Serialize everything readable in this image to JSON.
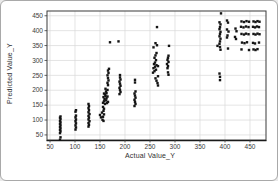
{
  "window": {
    "type": "chart-screenshot"
  },
  "chart_data": {
    "type": "scatter",
    "title": "",
    "xlabel": "Actual Value_Y",
    "ylabel": "Predicted Value_Y",
    "xlim": [
      44,
      482
    ],
    "ylim": [
      33,
      466
    ],
    "xticks": [
      50,
      100,
      150,
      200,
      250,
      300,
      350,
      400,
      450
    ],
    "yticks": [
      50,
      100,
      150,
      200,
      250,
      300,
      350,
      400,
      450
    ],
    "grid": true,
    "legend_position": "none",
    "marker": {
      "shape": "square",
      "size": 2.4,
      "color": "#141414"
    },
    "style": {
      "grid_color": "#d8d8d8",
      "frame_color": "#3a3a3a",
      "tick_label_color": "#3a3a3a",
      "background": "#ffffff",
      "outer_border": "#a9a9a9",
      "tick_font_size": 6.5
    },
    "points": [
      [
        70,
        34
      ],
      [
        71,
        42
      ],
      [
        70,
        56
      ],
      [
        71,
        62
      ],
      [
        70,
        67
      ],
      [
        71,
        72
      ],
      [
        70,
        77
      ],
      [
        71,
        82
      ],
      [
        70,
        87
      ],
      [
        71,
        92
      ],
      [
        70,
        97
      ],
      [
        71,
        103
      ],
      [
        70,
        108
      ],
      [
        71,
        112
      ],
      [
        101,
        68
      ],
      [
        102,
        75
      ],
      [
        101,
        82
      ],
      [
        102,
        89
      ],
      [
        101,
        96
      ],
      [
        102,
        102
      ],
      [
        101,
        109
      ],
      [
        102,
        115
      ],
      [
        101,
        128
      ],
      [
        102,
        133
      ],
      [
        127,
        78
      ],
      [
        128,
        84
      ],
      [
        127,
        90
      ],
      [
        129,
        96
      ],
      [
        127,
        102
      ],
      [
        128,
        108
      ],
      [
        127,
        114
      ],
      [
        129,
        120
      ],
      [
        127,
        126
      ],
      [
        128,
        133
      ],
      [
        127,
        140
      ],
      [
        128,
        147
      ],
      [
        127,
        154
      ],
      [
        150,
        117
      ],
      [
        152,
        109
      ],
      [
        155,
        101
      ],
      [
        157,
        97
      ],
      [
        156,
        111
      ],
      [
        158,
        119
      ],
      [
        154,
        125
      ],
      [
        157,
        131
      ],
      [
        158,
        138
      ],
      [
        156,
        144
      ],
      [
        156,
        158
      ],
      [
        160,
        154
      ],
      [
        164,
        157
      ],
      [
        158,
        163
      ],
      [
        162,
        166
      ],
      [
        166,
        161
      ],
      [
        159,
        170
      ],
      [
        163,
        173
      ],
      [
        157,
        177
      ],
      [
        161,
        181
      ],
      [
        165,
        179
      ],
      [
        160,
        186
      ],
      [
        163,
        190
      ],
      [
        158,
        189
      ],
      [
        162,
        196
      ],
      [
        165,
        201
      ],
      [
        161,
        205
      ],
      [
        166,
        217
      ],
      [
        165,
        225
      ],
      [
        167,
        233
      ],
      [
        166,
        241
      ],
      [
        165,
        250
      ],
      [
        167,
        258
      ],
      [
        166,
        266
      ],
      [
        168,
        272
      ],
      [
        170,
        361
      ],
      [
        187,
        364
      ],
      [
        189,
        187
      ],
      [
        191,
        194
      ],
      [
        190,
        201
      ],
      [
        189,
        208
      ],
      [
        191,
        215
      ],
      [
        190,
        222
      ],
      [
        189,
        229
      ],
      [
        191,
        236
      ],
      [
        190,
        243
      ],
      [
        190,
        251
      ],
      [
        219,
        147
      ],
      [
        221,
        154
      ],
      [
        220,
        161
      ],
      [
        219,
        168
      ],
      [
        221,
        175
      ],
      [
        220,
        182
      ],
      [
        219,
        189
      ],
      [
        221,
        196
      ],
      [
        220,
        226
      ],
      [
        220,
        235
      ],
      [
        264,
        412
      ],
      [
        261,
        358
      ],
      [
        264,
        351
      ],
      [
        257,
        344
      ],
      [
        260,
        293
      ],
      [
        262,
        301
      ],
      [
        259,
        309
      ],
      [
        261,
        317
      ],
      [
        263,
        325
      ],
      [
        256,
        259
      ],
      [
        259,
        264
      ],
      [
        262,
        269
      ],
      [
        257,
        274
      ],
      [
        260,
        279
      ],
      [
        263,
        284
      ],
      [
        258,
        288
      ],
      [
        266,
        281
      ],
      [
        266,
        247
      ],
      [
        261,
        240
      ],
      [
        263,
        232
      ],
      [
        265,
        224
      ],
      [
        266,
        216
      ],
      [
        288,
        349
      ],
      [
        287,
        252
      ],
      [
        286,
        260
      ],
      [
        285,
        274
      ],
      [
        286,
        281
      ],
      [
        284,
        288
      ],
      [
        287,
        295
      ],
      [
        285,
        302
      ],
      [
        286,
        309
      ],
      [
        287,
        316
      ],
      [
        392,
        458
      ],
      [
        389,
        428
      ],
      [
        391,
        421
      ],
      [
        390,
        412
      ],
      [
        389,
        405
      ],
      [
        391,
        396
      ],
      [
        390,
        389
      ],
      [
        389,
        381
      ],
      [
        391,
        373
      ],
      [
        390,
        364
      ],
      [
        389,
        356
      ],
      [
        385,
        349
      ],
      [
        390,
        345
      ],
      [
        391,
        336
      ],
      [
        389,
        256
      ],
      [
        390,
        245
      ],
      [
        390,
        234
      ],
      [
        404,
        434
      ],
      [
        406,
        427
      ],
      [
        404,
        404
      ],
      [
        407,
        397
      ],
      [
        405,
        384
      ],
      [
        404,
        377
      ],
      [
        406,
        340
      ],
      [
        421,
        407
      ],
      [
        423,
        398
      ],
      [
        420,
        379
      ],
      [
        422,
        372
      ],
      [
        433,
        431
      ],
      [
        438,
        429
      ],
      [
        443,
        432
      ],
      [
        448,
        430
      ],
      [
        457,
        431
      ],
      [
        461,
        429
      ],
      [
        465,
        432
      ],
      [
        469,
        430
      ],
      [
        432,
        413
      ],
      [
        437,
        411
      ],
      [
        442,
        414
      ],
      [
        447,
        412
      ],
      [
        456,
        413
      ],
      [
        460,
        411
      ],
      [
        464,
        414
      ],
      [
        468,
        412
      ],
      [
        433,
        389
      ],
      [
        438,
        387
      ],
      [
        442,
        390
      ],
      [
        447,
        388
      ],
      [
        457,
        389
      ],
      [
        461,
        387
      ],
      [
        465,
        390
      ],
      [
        469,
        388
      ],
      [
        434,
        360
      ],
      [
        439,
        358
      ],
      [
        444,
        361
      ],
      [
        456,
        359
      ],
      [
        460,
        357
      ],
      [
        468,
        360
      ],
      [
        433,
        337
      ],
      [
        448,
        335
      ],
      [
        457,
        337
      ],
      [
        461,
        335
      ],
      [
        465,
        338
      ]
    ]
  }
}
